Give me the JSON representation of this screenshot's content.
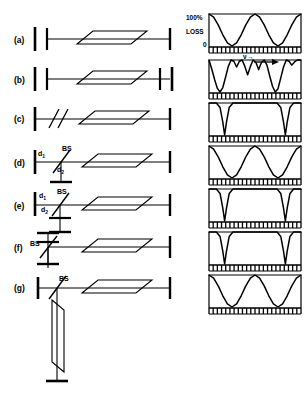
{
  "figure": {
    "ink_color": "#000000",
    "background": "#ffffff"
  },
  "axis": {
    "top_label": "100%",
    "mid_label": "LOSS",
    "zero_label": "0",
    "frequency_label": "ν",
    "frequency_arrow": "→",
    "ylim": [
      0,
      100
    ],
    "grid": false,
    "tick_count": 22
  },
  "rows": [
    {
      "id": "a",
      "label": "(a)",
      "annotations": [],
      "chart_data": {
        "type": "line",
        "title": "",
        "xlabel": "ν",
        "ylabel": "LOSS",
        "ylim": [
          0,
          100
        ],
        "tick_labels": [
          "0",
          "LOSS",
          "100%"
        ],
        "curve": "broad cosine, two full periods, full modulation depth",
        "period": 0.5,
        "depth": 100,
        "shape": "cosine",
        "x": [
          0.0,
          0.05,
          0.1,
          0.15,
          0.2,
          0.25,
          0.3,
          0.35,
          0.4,
          0.45,
          0.5,
          0.55,
          0.6,
          0.65,
          0.7,
          0.75,
          0.8,
          0.85,
          0.9,
          0.95,
          1.0
        ],
        "values": [
          100,
          90,
          66,
          35,
          10,
          0,
          10,
          35,
          66,
          90,
          100,
          90,
          66,
          35,
          10,
          0,
          10,
          35,
          66,
          90,
          100
        ]
      }
    },
    {
      "id": "b",
      "label": "(b)",
      "annotations": [],
      "chart_data": {
        "type": "line",
        "title": "",
        "xlabel": "ν",
        "ylabel": "LOSS",
        "ylim": [
          0,
          100
        ],
        "curve": "two-element interference: deep broad minima with secondary ripple maxima between",
        "shape": "composite",
        "x": [
          0.0,
          0.03,
          0.06,
          0.09,
          0.12,
          0.15,
          0.18,
          0.21,
          0.24,
          0.27,
          0.3,
          0.33,
          0.36,
          0.39,
          0.42,
          0.45,
          0.48,
          0.51,
          0.54,
          0.57,
          0.6,
          0.63,
          0.66,
          0.69,
          0.72,
          0.75,
          0.78,
          0.81,
          0.84,
          0.87,
          0.9,
          0.93,
          0.96,
          1.0
        ],
        "values": [
          100,
          72,
          40,
          12,
          0,
          14,
          46,
          80,
          100,
          96,
          78,
          96,
          100,
          80,
          54,
          80,
          100,
          92,
          70,
          92,
          100,
          84,
          50,
          18,
          0,
          10,
          44,
          78,
          100,
          96,
          84,
          94,
          100,
          100
        ]
      }
    },
    {
      "id": "c",
      "label": "(c)",
      "annotations": [],
      "chart_data": {
        "type": "line",
        "title": "",
        "xlabel": "ν",
        "ylabel": "LOSS",
        "ylim": [
          0,
          100
        ],
        "curve": "flat near 100% with two narrow sharp dips to 0",
        "shape": "narrow-dips",
        "dip_positions": [
          0.17,
          0.83
        ],
        "dip_width": 0.07,
        "x": [
          0.0,
          0.08,
          0.12,
          0.15,
          0.17,
          0.19,
          0.22,
          0.26,
          0.4,
          0.6,
          0.74,
          0.78,
          0.81,
          0.83,
          0.85,
          0.88,
          0.92,
          1.0
        ],
        "values": [
          100,
          100,
          86,
          40,
          0,
          40,
          86,
          100,
          100,
          100,
          100,
          86,
          40,
          0,
          40,
          86,
          100,
          100
        ]
      }
    },
    {
      "id": "d",
      "label": "(d)",
      "annotations": [
        {
          "text": "BS",
          "name": "beamsplitter-label"
        },
        {
          "text": "d",
          "sub": "1",
          "name": "arm-d1-label"
        },
        {
          "text": "d",
          "sub": "2",
          "name": "arm-d2-label"
        }
      ],
      "chart_data": {
        "type": "line",
        "title": "",
        "xlabel": "ν",
        "ylabel": "LOSS",
        "ylim": [
          0,
          100
        ],
        "curve": "smooth cosine, two full periods, full modulation depth",
        "period": 0.5,
        "depth": 100,
        "shape": "cosine",
        "x": [
          0.0,
          0.05,
          0.1,
          0.15,
          0.2,
          0.25,
          0.3,
          0.35,
          0.4,
          0.45,
          0.5,
          0.55,
          0.6,
          0.65,
          0.7,
          0.75,
          0.8,
          0.85,
          0.9,
          0.95,
          1.0
        ],
        "values": [
          100,
          90,
          66,
          35,
          10,
          0,
          10,
          35,
          66,
          90,
          100,
          90,
          66,
          35,
          10,
          0,
          10,
          35,
          66,
          90,
          100
        ]
      }
    },
    {
      "id": "e",
      "label": "(e)",
      "annotations": [
        {
          "text": "BS",
          "name": "beamsplitter-label"
        },
        {
          "text": "d",
          "sub": "1",
          "name": "arm-d1-label"
        },
        {
          "text": "d",
          "sub": "2",
          "name": "arm-d2-label"
        }
      ],
      "chart_data": {
        "type": "line",
        "title": "",
        "xlabel": "ν",
        "ylabel": "LOSS",
        "ylim": [
          0,
          100
        ],
        "curve": "flat near 100% with two narrow sharp dips to 0",
        "shape": "narrow-dips",
        "dip_positions": [
          0.17,
          0.83
        ],
        "dip_width": 0.07,
        "x": [
          0.0,
          0.08,
          0.12,
          0.15,
          0.17,
          0.19,
          0.22,
          0.26,
          0.4,
          0.6,
          0.74,
          0.78,
          0.81,
          0.83,
          0.85,
          0.88,
          0.92,
          1.0
        ],
        "values": [
          100,
          100,
          86,
          40,
          0,
          40,
          86,
          100,
          100,
          100,
          100,
          86,
          40,
          0,
          40,
          86,
          100,
          100
        ]
      }
    },
    {
      "id": "f",
      "label": "(f)",
      "annotations": [
        {
          "text": "BS",
          "name": "beamsplitter-label"
        }
      ],
      "chart_data": {
        "type": "line",
        "title": "",
        "xlabel": "ν",
        "ylabel": "LOSS",
        "ylim": [
          0,
          100
        ],
        "curve": "flat near 100% with two narrow sharp dips to 0",
        "shape": "narrow-dips",
        "dip_positions": [
          0.17,
          0.83
        ],
        "dip_width": 0.07,
        "x": [
          0.0,
          0.08,
          0.12,
          0.15,
          0.17,
          0.19,
          0.22,
          0.26,
          0.4,
          0.6,
          0.74,
          0.78,
          0.81,
          0.83,
          0.85,
          0.88,
          0.92,
          1.0
        ],
        "values": [
          100,
          100,
          86,
          40,
          0,
          40,
          86,
          100,
          100,
          100,
          100,
          86,
          40,
          0,
          40,
          86,
          100,
          100
        ]
      }
    },
    {
      "id": "g",
      "label": "(g)",
      "annotations": [
        {
          "text": "BS",
          "name": "beamsplitter-label"
        }
      ],
      "chart_data": {
        "type": "line",
        "title": "",
        "xlabel": "ν",
        "ylabel": "LOSS",
        "ylim": [
          0,
          100
        ],
        "curve": "smooth cosine, two full periods, full modulation depth",
        "period": 0.5,
        "depth": 100,
        "shape": "cosine",
        "x": [
          0.0,
          0.05,
          0.1,
          0.15,
          0.2,
          0.25,
          0.3,
          0.35,
          0.4,
          0.45,
          0.5,
          0.55,
          0.6,
          0.65,
          0.7,
          0.75,
          0.8,
          0.85,
          0.9,
          0.95,
          1.0
        ],
        "values": [
          100,
          90,
          66,
          35,
          10,
          0,
          10,
          35,
          66,
          90,
          100,
          90,
          66,
          35,
          10,
          0,
          10,
          35,
          66,
          90,
          100
        ]
      }
    }
  ]
}
